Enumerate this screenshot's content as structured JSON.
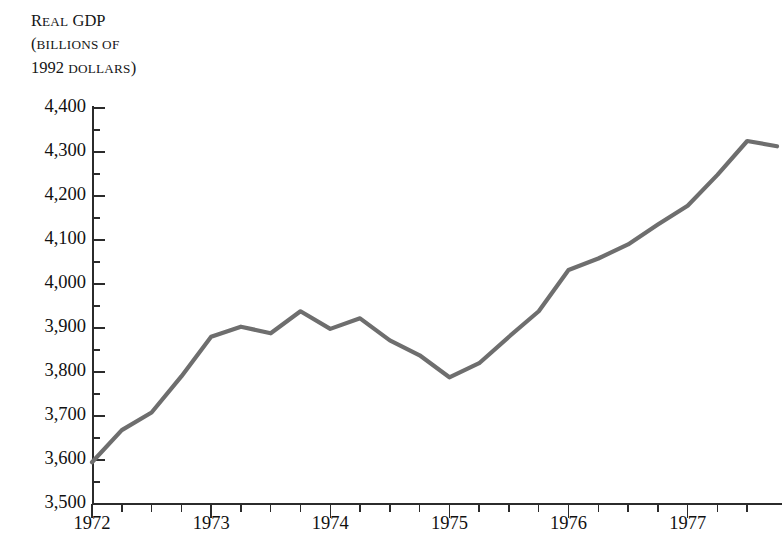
{
  "figure": {
    "title_cropped": "Real GDP and the Recession of 1973–1975",
    "y_axis_caption": {
      "line1_main": "Real GDP",
      "line1_smallcaps": "eal",
      "line2": "(billions of",
      "line3_year": "1992",
      "line3_word": "dollars)"
    }
  },
  "chart_data": {
    "type": "line",
    "title": "Real GDP and the Recession of 1973–1975",
    "xlabel": "",
    "ylabel": "Real GDP (billions of 1992 dollars)",
    "ylim": [
      3500,
      4400
    ],
    "xlim": [
      1972.0,
      1977.75
    ],
    "grid": false,
    "legend": null,
    "y_major_ticks": [
      3500,
      3600,
      3700,
      3800,
      3900,
      4000,
      4100,
      4200,
      4300,
      4400
    ],
    "y_tick_labels": [
      "3,500",
      "3,600",
      "3,700",
      "3,800",
      "3,900",
      "4,000",
      "4,100",
      "4,200",
      "4,300",
      "4,400"
    ],
    "y_minor_ticks": [
      3550,
      3650,
      3750,
      3850,
      3950,
      4050,
      4150,
      4250,
      4350
    ],
    "x_major_ticks": [
      1972,
      1973,
      1974,
      1975,
      1976,
      1977
    ],
    "x_tick_labels": [
      "1972",
      "1973",
      "1974",
      "1975",
      "1976",
      "1977"
    ],
    "x_minor_ticks": [
      1972.25,
      1972.5,
      1972.75,
      1973.25,
      1973.5,
      1973.75,
      1974.25,
      1974.5,
      1974.75,
      1975.25,
      1975.5,
      1975.75,
      1976.25,
      1976.5,
      1976.75,
      1977.25,
      1977.5
    ],
    "series": [
      {
        "name": "Real GDP",
        "color": "#6e6e6e",
        "line_width": 4.2,
        "x": [
          1972.0,
          1972.25,
          1972.5,
          1972.75,
          1973.0,
          1973.25,
          1973.5,
          1973.75,
          1974.0,
          1974.25,
          1974.5,
          1974.75,
          1975.0,
          1975.25,
          1975.5,
          1975.75,
          1976.0,
          1976.25,
          1976.5,
          1976.75,
          1977.0,
          1977.25,
          1977.5,
          1977.75
        ],
        "x_labels": [
          "1972 Q1",
          "1972 Q2",
          "1972 Q3",
          "1972 Q4",
          "1973 Q1",
          "1973 Q2",
          "1973 Q3",
          "1973 Q4",
          "1974 Q1",
          "1974 Q2",
          "1974 Q3",
          "1974 Q4",
          "1975 Q1",
          "1975 Q2",
          "1975 Q3",
          "1975 Q4",
          "1976 Q1",
          "1976 Q2",
          "1976 Q3",
          "1976 Q4",
          "1977 Q1",
          "1977 Q2",
          "1977 Q3",
          "1977 Q4"
        ],
        "values": [
          3595,
          3668,
          3708,
          3790,
          3880,
          3903,
          3888,
          3938,
          3898,
          3922,
          3872,
          3838,
          3788,
          3820,
          3880,
          3938,
          4032,
          4058,
          4090,
          4135,
          4178,
          4248,
          4325,
          4313
        ]
      }
    ]
  }
}
